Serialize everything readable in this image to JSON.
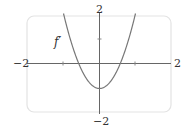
{
  "chart_data": {
    "type": "line",
    "title": "",
    "function_label": "f′",
    "expression": "3x^2 - 1",
    "xlim": [
      -2,
      2
    ],
    "ylim": [
      -2,
      2
    ],
    "grid": false,
    "legend": "none",
    "x_tick_labels": {
      "left": "−2",
      "right": "2"
    },
    "y_tick_labels": {
      "top": "2",
      "bottom": "−2"
    },
    "x_ticks": [
      -1,
      1
    ],
    "y_ticks": [
      1
    ],
    "series": [
      {
        "name": "f′",
        "x": [
          -1.0,
          -0.8,
          -0.6,
          -0.577,
          -0.4,
          -0.2,
          0.0,
          0.2,
          0.4,
          0.577,
          0.6,
          0.8,
          1.0
        ],
        "y": [
          2.0,
          0.92,
          0.08,
          0.0,
          -0.52,
          -0.88,
          -1.0,
          -0.88,
          -0.52,
          0.0,
          0.08,
          0.92,
          2.0
        ]
      }
    ],
    "colors": {
      "curve": "#777777",
      "axes": "#666666",
      "frame": "#e6e6e6"
    }
  }
}
